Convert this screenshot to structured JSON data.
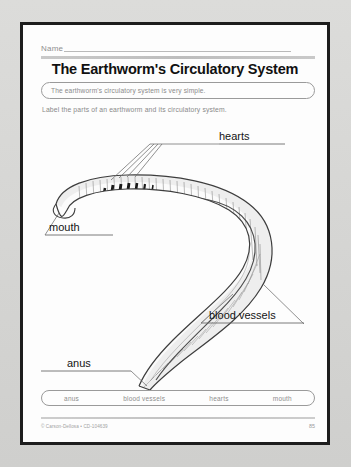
{
  "page": {
    "name_label": "Name",
    "title": "The Earthworm's Circulatory System",
    "fact": "The earthworm's circulatory system is very simple.",
    "instruction": "Label the parts of an earthworm and its circulatory system."
  },
  "diagram": {
    "subject": "earthworm",
    "labels": [
      {
        "id": "hearts",
        "text": "hearts"
      },
      {
        "id": "mouth",
        "text": "mouth"
      },
      {
        "id": "blood-vessels",
        "text": "blood vessels"
      },
      {
        "id": "anus",
        "text": "anus"
      }
    ]
  },
  "wordbank": {
    "terms": [
      "anus",
      "blood vessels",
      "hearts",
      "mouth"
    ]
  },
  "footer": {
    "credit": "© Carson-Dellosa • CD-104639",
    "page_number": "85"
  },
  "colors": {
    "page_border": "#1d1d1d",
    "ink": "#111111",
    "muted_text": "#8a8a8a",
    "rule": "#b9b9b9",
    "backdrop": "#d8d8d6"
  }
}
